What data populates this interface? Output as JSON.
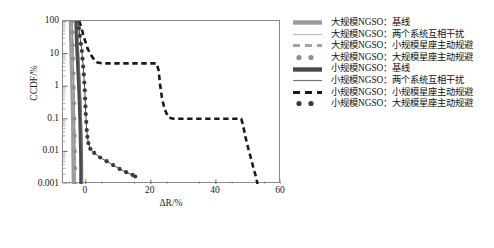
{
  "chart_data": {
    "type": "line",
    "title": "",
    "xlabel": "ΔR/%",
    "ylabel": "CCDF/%",
    "yscale": "log",
    "xscale": "linear",
    "xlim": [
      -7,
      60
    ],
    "ylim": [
      0.001,
      100
    ],
    "xticks": [
      0,
      20,
      40,
      60
    ],
    "yticks": [
      100,
      10,
      1,
      0.1,
      0.01,
      0.001
    ],
    "ytick_labels": [
      "100",
      "10",
      "1",
      "0.1",
      "0.01",
      "0.001"
    ],
    "xtick_labels": [
      "0",
      "20",
      "40",
      "60"
    ],
    "grid": false,
    "legend_position": "right",
    "series": [
      {
        "name": "大规模NGSO：基线",
        "style": "solid-thick",
        "color": "#9a9a9a",
        "width": 4.2,
        "points": [
          [
            -4.6,
            100
          ],
          [
            -4.55,
            60
          ],
          [
            -4.5,
            30
          ],
          [
            -4.4,
            12
          ],
          [
            -4.3,
            5
          ],
          [
            -4.2,
            2
          ],
          [
            -4.1,
            0.8
          ],
          [
            -4.0,
            0.3
          ],
          [
            -3.9,
            0.1
          ],
          [
            -3.85,
            0.03
          ],
          [
            -3.8,
            0.01
          ],
          [
            -3.75,
            0.004
          ],
          [
            -3.7,
            0.0015
          ],
          [
            -3.7,
            0.001
          ]
        ]
      },
      {
        "name": "大规模NGSO：两个系统互相干扰",
        "style": "solid-thin",
        "color": "#b9b9b9",
        "width": 1.1,
        "points": [
          [
            -4.4,
            100
          ],
          [
            -4.35,
            55
          ],
          [
            -4.3,
            25
          ],
          [
            -4.2,
            10
          ],
          [
            -4.1,
            4
          ],
          [
            -4.0,
            1.5
          ],
          [
            -3.9,
            0.6
          ],
          [
            -3.8,
            0.2
          ],
          [
            -3.7,
            0.07
          ],
          [
            -3.6,
            0.02
          ],
          [
            -3.55,
            0.007
          ],
          [
            -3.5,
            0.002
          ],
          [
            -3.5,
            0.001
          ]
        ]
      },
      {
        "name": "大规模NGSO：小规模星座主动规避",
        "style": "dashed",
        "color": "#a3a3a3",
        "width": 2.4,
        "points": [
          [
            -4.3,
            100
          ],
          [
            -4.2,
            40
          ],
          [
            -4.1,
            15
          ],
          [
            -4.0,
            6
          ],
          [
            -3.9,
            2
          ],
          [
            -3.8,
            0.7
          ],
          [
            -3.7,
            0.25
          ],
          [
            -3.6,
            0.08
          ],
          [
            -3.5,
            0.025
          ],
          [
            -3.45,
            0.008
          ],
          [
            -3.4,
            0.0025
          ],
          [
            -3.4,
            0.001
          ]
        ]
      },
      {
        "name": "大规模NGSO：大规模星座主动规避",
        "style": "dotted-markers",
        "color": "#8f8f8f",
        "width": 2.0,
        "points": [
          [
            -4.2,
            100
          ],
          [
            -4.1,
            45
          ],
          [
            -4.0,
            18
          ],
          [
            -3.9,
            7
          ],
          [
            -3.8,
            2.5
          ],
          [
            -3.7,
            0.9
          ],
          [
            -3.6,
            0.3
          ],
          [
            -3.5,
            0.1
          ],
          [
            -3.4,
            0.03
          ],
          [
            -3.35,
            0.01
          ],
          [
            -3.3,
            0.003
          ],
          [
            -3.3,
            0.001
          ]
        ]
      },
      {
        "name": "小规模NGSO：基线",
        "style": "solid-thick",
        "color": "#4a4a4a",
        "width": 3.6,
        "points": [
          [
            -3.0,
            100
          ],
          [
            -2.9,
            55
          ],
          [
            -2.8,
            25
          ],
          [
            -2.6,
            10
          ],
          [
            -2.4,
            4
          ],
          [
            -2.2,
            1.5
          ],
          [
            -2.0,
            0.55
          ],
          [
            -1.85,
            0.2
          ],
          [
            -1.7,
            0.07
          ],
          [
            -1.6,
            0.022
          ],
          [
            -1.5,
            0.008
          ],
          [
            -1.45,
            0.003
          ],
          [
            -1.45,
            0.001
          ]
        ]
      },
      {
        "name": "小规模NGSO：两个系统互相干扰",
        "style": "solid-thin",
        "color": "#707070",
        "width": 1.1,
        "points": [
          [
            -2.6,
            100
          ],
          [
            -2.5,
            50
          ],
          [
            -2.3,
            20
          ],
          [
            -2.1,
            8
          ],
          [
            -1.9,
            3
          ],
          [
            -1.7,
            1.1
          ],
          [
            -1.5,
            0.4
          ],
          [
            -1.35,
            0.14
          ],
          [
            -1.2,
            0.05
          ],
          [
            -1.1,
            0.017
          ],
          [
            -1.0,
            0.006
          ],
          [
            -0.95,
            0.002
          ],
          [
            -0.95,
            0.001
          ]
        ]
      },
      {
        "name": "小规模NGSO：小规模星座主动规避",
        "style": "dashed",
        "color": "#1a1a1a",
        "width": 2.6,
        "points": [
          [
            -2.0,
            100
          ],
          [
            -1.2,
            55
          ],
          [
            -0.4,
            28
          ],
          [
            0.6,
            14
          ],
          [
            1.6,
            9
          ],
          [
            2.6,
            6.5
          ],
          [
            3.6,
            5.3
          ],
          [
            5.0,
            5.0
          ],
          [
            10.0,
            5.0
          ],
          [
            16.0,
            5.0
          ],
          [
            21.8,
            5.0
          ],
          [
            22.4,
            3.0
          ],
          [
            22.8,
            1.2
          ],
          [
            23.4,
            0.45
          ],
          [
            24.2,
            0.2
          ],
          [
            25.4,
            0.11
          ],
          [
            27.0,
            0.1
          ],
          [
            34.0,
            0.1
          ],
          [
            42.0,
            0.1
          ],
          [
            47.8,
            0.1
          ],
          [
            48.4,
            0.06
          ],
          [
            49.0,
            0.03
          ],
          [
            49.8,
            0.014
          ],
          [
            50.6,
            0.007
          ],
          [
            51.4,
            0.0035
          ],
          [
            52.2,
            0.0018
          ],
          [
            52.8,
            0.001
          ]
        ]
      },
      {
        "name": "小规模NGSO：大规模星座主动规避",
        "style": "dotted-markers",
        "color": "#3a3a3a",
        "width": 2.0,
        "points": [
          [
            -2.4,
            100
          ],
          [
            -2.1,
            60
          ],
          [
            -1.8,
            35
          ],
          [
            -1.5,
            20
          ],
          [
            -1.2,
            12
          ],
          [
            -1.0,
            7
          ],
          [
            -0.8,
            4
          ],
          [
            -0.6,
            2.3
          ],
          [
            -0.45,
            1.3
          ],
          [
            -0.3,
            0.75
          ],
          [
            -0.2,
            0.42
          ],
          [
            -0.1,
            0.24
          ],
          [
            0.0,
            0.14
          ],
          [
            0.15,
            0.08
          ],
          [
            0.3,
            0.045
          ],
          [
            0.5,
            0.028
          ],
          [
            0.8,
            0.018
          ],
          [
            1.4,
            0.012
          ],
          [
            2.6,
            0.009
          ],
          [
            4.4,
            0.0065
          ],
          [
            6.4,
            0.005
          ],
          [
            8.4,
            0.0038
          ],
          [
            10.4,
            0.0029
          ],
          [
            12.4,
            0.0023
          ],
          [
            14.4,
            0.0019
          ],
          [
            15.2,
            0.0017
          ]
        ]
      }
    ]
  },
  "legend": {
    "items": [
      {
        "label": "大规模NGSO：基线",
        "marker": "solid-thick-line-marker"
      },
      {
        "label": "大规模NGSO：两个系统互相干扰",
        "marker": "thin-line-marker"
      },
      {
        "label": "大规模NGSO：小规模星座主动规避",
        "marker": "dashed-line-marker"
      },
      {
        "label": "大规模NGSO：大规模星座主动规避",
        "marker": "dotted-circle-marker"
      },
      {
        "label": "小规模NGSO：基线",
        "marker": "solid-thick-line-marker"
      },
      {
        "label": "小规模NGSO：两个系统互相干扰",
        "marker": "thin-line-marker"
      },
      {
        "label": "小规模NGSO：小规模星座主动规避",
        "marker": "dashed-line-marker"
      },
      {
        "label": "小规模NGSO：大规模星座主动规避",
        "marker": "dotted-circle-marker"
      }
    ]
  }
}
